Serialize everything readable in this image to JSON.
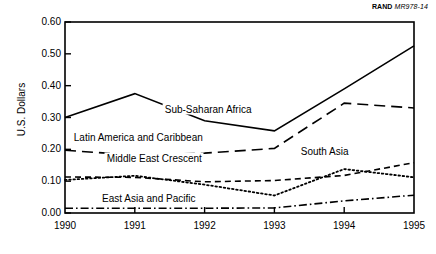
{
  "credit": {
    "org": "RAND",
    "document": "MR978-14"
  },
  "chart_data": {
    "type": "line",
    "title": "",
    "xlabel": "",
    "ylabel": "U.S. Dollars",
    "x": [
      1990,
      1991,
      1992,
      1993,
      1994,
      1995
    ],
    "categories": [
      "1990",
      "1991",
      "1992",
      "1993",
      "1994",
      "1995"
    ],
    "xlim": [
      1990,
      1995
    ],
    "ylim": [
      0.0,
      0.6
    ],
    "ytick_labels": [
      "0.00",
      "0.10",
      "0.20",
      "0.30",
      "0.40",
      "0.50",
      "0.60"
    ],
    "ytick_values": [
      0.0,
      0.1,
      0.2,
      0.3,
      0.4,
      0.5,
      0.6
    ],
    "grid": false,
    "legend_position": "inline-annotations",
    "series": [
      {
        "name": "Sub-Saharan Africa",
        "style": "solid",
        "values": [
          0.3,
          0.375,
          0.29,
          0.258,
          0.39,
          0.525
        ],
        "label_x": 1992.05,
        "label_y": 0.327
      },
      {
        "name": "Latin America and Caribbean",
        "style": "long-dash",
        "values": [
          0.197,
          0.182,
          0.188,
          0.203,
          0.345,
          0.33
        ],
        "label_x": 1991.05,
        "label_y": 0.238
      },
      {
        "name": "Middle East Crescent",
        "style": "dashed",
        "values": [
          0.113,
          0.112,
          0.098,
          0.102,
          0.118,
          0.158
        ],
        "label_x": 1991.28,
        "label_y": 0.172
      },
      {
        "name": "South Asia",
        "style": "dotted",
        "values": [
          0.104,
          0.117,
          0.089,
          0.055,
          0.138,
          0.112
        ],
        "label_x": 1993.72,
        "label_y": 0.196
      },
      {
        "name": "East Asia and Pacific",
        "style": "dash-dot",
        "values": [
          0.015,
          0.015,
          0.015,
          0.016,
          0.038,
          0.056
        ],
        "label_x": 1991.2,
        "label_y": 0.047
      }
    ]
  }
}
